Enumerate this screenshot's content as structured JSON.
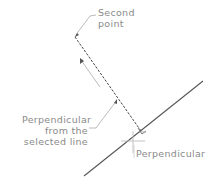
{
  "diagram": {
    "labels": {
      "second_point_line1": "Second",
      "second_point_line2": "point",
      "perp_from_line1": "Perpendicular",
      "perp_from_line2": "from the",
      "perp_from_line3": "selected line",
      "perpendicular_snap": "Perpendicular"
    },
    "colors": {
      "selected_line": "#555555",
      "dashed_line": "#444444",
      "leader": "#aaaaaa",
      "text": "#8a8a8a"
    }
  }
}
